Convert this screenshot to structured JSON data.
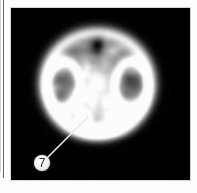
{
  "figure": {
    "modality": "PET brain scan",
    "view": "transaxial slice",
    "colormap": "grayscale",
    "panel": {
      "background_color": "#050505",
      "x": 11,
      "y": 8,
      "width": 179,
      "height": 172
    },
    "page_background_color": "#fefefe",
    "page_rule_color": "#4a4a4a"
  },
  "scan": {
    "center_x": 86,
    "center_y": 77,
    "radius_x": 58,
    "radius_y": 56,
    "description": "Transaxial grayscale brain slice with bright cortical rim, symmetric dark ventricular regions and two bright inferior hotspots",
    "structures": [
      {
        "name": "cortical-rim",
        "kind": "ring",
        "cx": 86,
        "cy": 74,
        "rx": 54,
        "ry": 52,
        "thickness": 11,
        "intensity": 0.92
      },
      {
        "name": "left-ventricle-rim",
        "kind": "ring",
        "cx": 52,
        "cy": 77,
        "rx": 16,
        "ry": 24,
        "thickness": 7,
        "intensity": 0.82
      },
      {
        "name": "right-ventricle-rim",
        "kind": "ring",
        "cx": 120,
        "cy": 77,
        "rx": 16,
        "ry": 24,
        "thickness": 7,
        "intensity": 0.84
      },
      {
        "name": "left-ventricle-cavity",
        "kind": "blob",
        "cx": 52,
        "cy": 79,
        "rx": 9,
        "ry": 16,
        "intensity": 0.3
      },
      {
        "name": "right-ventricle-cavity",
        "kind": "blob",
        "cx": 120,
        "cy": 79,
        "rx": 9,
        "ry": 16,
        "intensity": 0.28
      },
      {
        "name": "left-striatum-hotspot",
        "kind": "blob",
        "cx": 72,
        "cy": 110,
        "rx": 9,
        "ry": 8,
        "intensity": 1.0
      },
      {
        "name": "right-striatum-hotspot",
        "kind": "blob",
        "cx": 104,
        "cy": 110,
        "rx": 9,
        "ry": 8,
        "intensity": 1.0
      },
      {
        "name": "midline-uptake",
        "kind": "blob",
        "cx": 86,
        "cy": 68,
        "rx": 16,
        "ry": 22,
        "intensity": 0.5
      },
      {
        "name": "superior-midline-gap",
        "kind": "blob",
        "cx": 86,
        "cy": 40,
        "rx": 7,
        "ry": 12,
        "intensity": 0.22
      },
      {
        "name": "inferior-midline-uptake",
        "kind": "blob",
        "cx": 86,
        "cy": 122,
        "rx": 26,
        "ry": 9,
        "intensity": 0.72
      }
    ]
  },
  "callout": {
    "label": "7",
    "marker_center_x": 31,
    "marker_center_y": 155,
    "marker_radius": 8,
    "marker_fill_color": "#f4f4f4",
    "marker_text_color": "#2a2a2a",
    "leader_line_color": "#e8e8e8",
    "leader_line_width": 1.6,
    "leader_start_x": 37,
    "leader_start_y": 149,
    "leader_end_x": 77,
    "leader_end_y": 109,
    "points_to": "left-striatum-hotspot"
  }
}
